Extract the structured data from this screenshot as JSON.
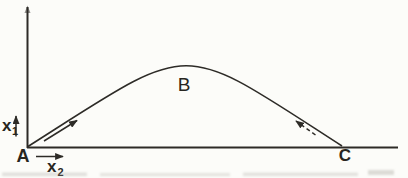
{
  "figure": {
    "background_color": "#fcfcf9",
    "ink_color": "#2d2b27",
    "artifact_color": "#a8a69f",
    "points": {
      "a": "A",
      "b": "B",
      "c": "C"
    },
    "axes": {
      "vertical_base": "x",
      "vertical_sub": "1",
      "horizontal_base": "x",
      "horizontal_sub": "2"
    },
    "curve": {
      "start_label": "A",
      "apex_label": "B",
      "end_label": "C",
      "shape": "arch"
    },
    "arrows": {
      "ascent_style": "solid",
      "ascent_direction": "up-right",
      "descent_style": "dashed",
      "descent_direction": "up-left"
    }
  }
}
